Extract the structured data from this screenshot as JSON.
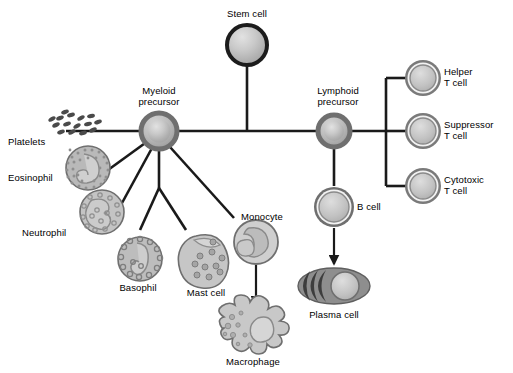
{
  "diagram": {
    "nodes": {
      "stem_cell": "Stem cell",
      "myeloid_precursor": "Myeloid\nprecursor",
      "lymphoid_precursor": "Lymphoid\nprecursor",
      "platelets": "Platelets",
      "eosinophil": "Eosinophil",
      "neutrophil": "Neutrophil",
      "basophil": "Basophil",
      "mast_cell": "Mast cell",
      "monocyte": "Monocyte",
      "macrophage": "Macrophage",
      "b_cell": "B cell",
      "plasma_cell": "Plasma cell",
      "helper_t_cell": "Helper\nT cell",
      "suppressor_t_cell": "Suppressor\nT cell",
      "cytotoxic_t_cell": "Cytotoxic\nT cell"
    },
    "colors": {
      "line": "#1a1a1a",
      "stem_outline": "#1c1c1c",
      "precursor_outline": "#6d6d6d",
      "cell_fill_light": "#d8d8d8",
      "cell_fill_mid": "#b5b5b5",
      "cell_fill_dark": "#8d8d8d",
      "background": "#ffffff",
      "text": "#000000"
    }
  }
}
